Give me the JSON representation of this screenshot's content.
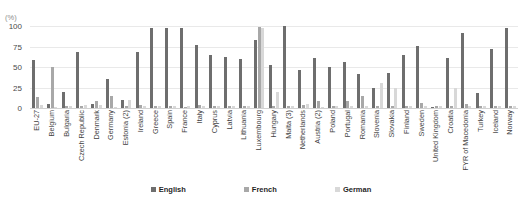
{
  "top_fragment": "",
  "unit_label": "(%)",
  "legend": {
    "position": "bottom-center",
    "items": [
      {
        "label": "English",
        "color": "#6e6e6e",
        "swatch_name": "legend-swatch-english"
      },
      {
        "label": "French",
        "color": "#a8a8a8",
        "swatch_name": "legend-swatch-french"
      },
      {
        "label": "German",
        "color": "#d8d8d8",
        "swatch_name": "legend-swatch-german"
      }
    ]
  },
  "chart_data": {
    "type": "bar",
    "title": "",
    "subtitle": "",
    "xlabel": "",
    "ylabel": "(%)",
    "ylim": [
      0,
      100
    ],
    "yticks": [
      100,
      75,
      50,
      25,
      0
    ],
    "grid": true,
    "legend_position": "bottom-center",
    "categories": [
      "EU-27",
      "Belgium",
      "Bulgaria",
      "Czech Republic",
      "Denmark",
      "Germany",
      "Estonia (2)",
      "Ireland",
      "Greece",
      "Spain",
      "France",
      "Italy",
      "Cyprus",
      "Latvia",
      "Lithuania",
      "Luxembourg",
      "Hungary",
      "Malta (3)",
      "Netherlands",
      "Austria (2)",
      "Poland",
      "Portugal",
      "Romania",
      "Slovenia",
      "Slovakia",
      "Finland",
      "Sweden",
      "United Kingdom",
      "Croatia",
      "FYR of Macedonia",
      "Turkey",
      "Iceland",
      "Norway"
    ],
    "series": [
      {
        "name": "English",
        "color": "#6e6e6e",
        "values": [
          59,
          5,
          20,
          68,
          5,
          35,
          10,
          68,
          97,
          97,
          98,
          77,
          65,
          62,
          60,
          83,
          53,
          100,
          46,
          61,
          50,
          56,
          42,
          25,
          43,
          65,
          76,
          1,
          61,
          91,
          18,
          72,
          98
        ]
      },
      {
        "name": "French",
        "color": "#a8a8a8",
        "values": [
          13,
          50,
          3,
          2,
          8,
          15,
          2,
          4,
          2,
          3,
          1,
          4,
          2,
          2,
          2,
          99,
          3,
          3,
          4,
          8,
          2,
          8,
          15,
          2,
          2,
          2,
          6,
          2,
          2,
          5,
          2,
          2,
          2
        ]
      },
      {
        "name": "German",
        "color": "#d8d8d8",
        "values": [
          4,
          1,
          3,
          4,
          4,
          1,
          10,
          2,
          2,
          2,
          2,
          2,
          2,
          2,
          2,
          98,
          19,
          2,
          5,
          1,
          3,
          2,
          3,
          30,
          25,
          2,
          3,
          2,
          24,
          2,
          2,
          2,
          2
        ]
      }
    ]
  }
}
